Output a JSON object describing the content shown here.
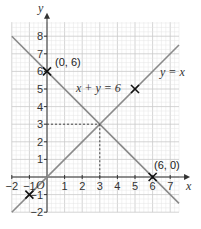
{
  "chart_data": {
    "type": "line",
    "title": "",
    "xlabel": "x",
    "ylabel": "y",
    "xlim": [
      -2,
      8
    ],
    "ylim": [
      -2,
      9
    ],
    "grid": true,
    "x_ticks": [
      "−2",
      "−1",
      "1",
      "2",
      "3",
      "4",
      "5",
      "6",
      "7"
    ],
    "y_ticks": [
      "−2",
      "−1",
      "1",
      "2",
      "3",
      "4",
      "5",
      "6",
      "7",
      "8"
    ],
    "origin_label": "O",
    "series": [
      {
        "name": "x + y = 6",
        "x": [
          -2,
          8
        ],
        "y": [
          8,
          -2
        ]
      },
      {
        "name": "y = x",
        "x": [
          -2,
          8
        ],
        "y": [
          -2,
          8
        ]
      }
    ],
    "marked_points": [
      {
        "label": "(0, 6)",
        "x": 0,
        "y": 6
      },
      {
        "label": "(6, 0)",
        "x": 6,
        "y": 0
      },
      {
        "label": "",
        "x": 5,
        "y": 5
      },
      {
        "label": "",
        "x": -1,
        "y": -1
      }
    ],
    "intersection": {
      "x": 3,
      "y": 3
    },
    "annotations": [
      "x + y = 6",
      "y = x",
      "(0, 6)",
      "(6, 0)"
    ]
  },
  "labels": {
    "x_axis": "x",
    "y_axis": "y",
    "origin": "O",
    "line1": "x + y = 6",
    "line2": "y = x",
    "pt_0_6": "(0, 6)",
    "pt_6_0": "(6, 0)"
  }
}
